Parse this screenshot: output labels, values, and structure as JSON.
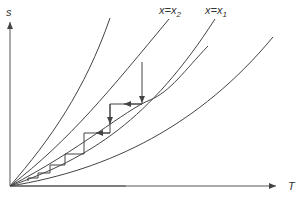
{
  "diagram": {
    "axes": {
      "y_label": "s",
      "x_label": "T"
    },
    "curve_labels": [
      {
        "var": "x",
        "eq": "=",
        "sym": "x",
        "sub": "2"
      },
      {
        "var": "x",
        "eq": "=",
        "sym": "x",
        "sub": "1"
      }
    ],
    "colors": {
      "line": "#444444",
      "background": "#ffffff"
    },
    "curves_count": 5,
    "staircase_steps": 7
  }
}
